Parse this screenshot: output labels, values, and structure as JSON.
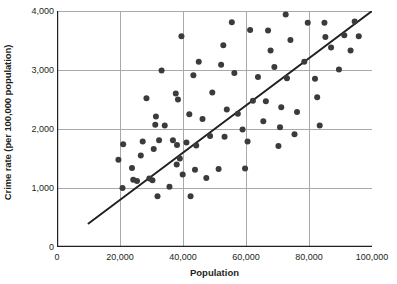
{
  "chart_data": {
    "type": "scatter",
    "title": "",
    "xlabel": "Population",
    "ylabel": "Crime rate (per 100,000 population)",
    "xlim": [
      0,
      100000
    ],
    "ylim": [
      0,
      4000
    ],
    "xticks": [
      "0",
      "20,000",
      "40,000",
      "60,000",
      "80,000",
      "100,000"
    ],
    "xtick_values": [
      0,
      20000,
      40000,
      60000,
      80000,
      100000
    ],
    "yticks": [
      "0",
      "1,000",
      "2,000",
      "3,000",
      "4,000"
    ],
    "ytick_values": [
      0,
      1000,
      2000,
      3000,
      4000
    ],
    "grid": true,
    "grid_color": "#a7a9ac",
    "legend": "none",
    "point_color": "#3b3b3b",
    "point_radius": 3,
    "trendline": {
      "label": "least-squares regression line",
      "color": "#231f20",
      "x": [
        10000,
        100000
      ],
      "y": [
        400,
        4000
      ]
    },
    "points": [
      [
        19500,
        1480
      ],
      [
        20800,
        1000
      ],
      [
        21000,
        1740
      ],
      [
        23800,
        1340
      ],
      [
        24200,
        1140
      ],
      [
        26600,
        1550
      ],
      [
        27200,
        1790
      ],
      [
        28400,
        2520
      ],
      [
        29300,
        1160
      ],
      [
        30300,
        1130
      ],
      [
        30700,
        1660
      ],
      [
        31200,
        2070
      ],
      [
        31400,
        2210
      ],
      [
        31900,
        860
      ],
      [
        32400,
        1810
      ],
      [
        33200,
        2990
      ],
      [
        34200,
        2060
      ],
      [
        35700,
        1020
      ],
      [
        37700,
        2600
      ],
      [
        38000,
        1400
      ],
      [
        38100,
        1730
      ],
      [
        38400,
        2500
      ],
      [
        39000,
        1500
      ],
      [
        39500,
        3570
      ],
      [
        39900,
        1230
      ],
      [
        41100,
        1770
      ],
      [
        42000,
        2250
      ],
      [
        42400,
        860
      ],
      [
        43300,
        2910
      ],
      [
        43800,
        1310
      ],
      [
        44200,
        1720
      ],
      [
        45000,
        3140
      ],
      [
        46200,
        2170
      ],
      [
        47400,
        1170
      ],
      [
        49300,
        2620
      ],
      [
        51300,
        1320
      ],
      [
        52100,
        3090
      ],
      [
        52800,
        3420
      ],
      [
        53200,
        1870
      ],
      [
        53900,
        2330
      ],
      [
        55500,
        3810
      ],
      [
        56300,
        2950
      ],
      [
        57400,
        2260
      ],
      [
        58900,
        1990
      ],
      [
        59700,
        1330
      ],
      [
        60500,
        1790
      ],
      [
        61300,
        3680
      ],
      [
        62200,
        2480
      ],
      [
        63800,
        2880
      ],
      [
        65500,
        2130
      ],
      [
        67000,
        3670
      ],
      [
        67800,
        3330
      ],
      [
        69000,
        3050
      ],
      [
        70300,
        1710
      ],
      [
        70800,
        2030
      ],
      [
        71200,
        2370
      ],
      [
        72600,
        3940
      ],
      [
        73000,
        2860
      ],
      [
        74100,
        3510
      ],
      [
        75400,
        1910
      ],
      [
        76200,
        2290
      ],
      [
        78500,
        3140
      ],
      [
        79600,
        3800
      ],
      [
        81900,
        2850
      ],
      [
        82600,
        2540
      ],
      [
        83400,
        2060
      ],
      [
        85200,
        3560
      ],
      [
        87000,
        3380
      ],
      [
        89500,
        3010
      ],
      [
        91200,
        3590
      ],
      [
        93200,
        3330
      ],
      [
        94500,
        3820
      ],
      [
        95800,
        3570
      ],
      [
        84900,
        3800
      ],
      [
        66300,
        2470
      ],
      [
        48600,
        1880
      ],
      [
        36800,
        1810
      ],
      [
        25400,
        1120
      ]
    ]
  },
  "axis": {
    "axis_line_color": "#231f20"
  }
}
